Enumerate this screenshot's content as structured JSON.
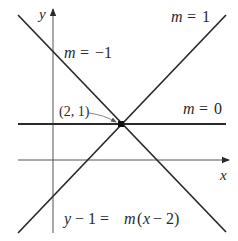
{
  "diagram": {
    "type": "family-of-lines",
    "colors": {
      "background": "#ffffff",
      "line": "#2a2a2a",
      "axis": "#555555",
      "text": "#2a2a2a"
    },
    "axes": {
      "x_label": "x",
      "y_label": "y"
    },
    "point": {
      "label": "(2, 1)",
      "x": 2,
      "y": 1
    },
    "lines": [
      {
        "slope_label_var": "m",
        "slope_label_eq": "=",
        "slope_label_val": "1",
        "slope": 1
      },
      {
        "slope_label_var": "m",
        "slope_label_eq": "=",
        "slope_label_val": "−1",
        "slope": -1
      },
      {
        "slope_label_var": "m",
        "slope_label_eq": "=",
        "slope_label_val": "0",
        "slope": 0
      }
    ],
    "equation": {
      "y": "y",
      "minus1": "− 1 =",
      "m": "m",
      "open": "(",
      "x": "x",
      "minus2": "− 2)"
    }
  }
}
